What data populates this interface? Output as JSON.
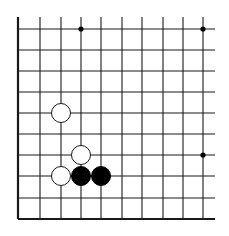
{
  "board": {
    "description": "Go board corner fragment (lower-left corner)",
    "colors": {
      "background": "#ffffff",
      "line": "#1a1a1a",
      "black_stone": "#000000",
      "white_stone_fill": "#ffffff",
      "white_stone_stroke": "#1a1a1a",
      "star_point": "#000000"
    },
    "columns_x": [
      18,
      40,
      61,
      81,
      101,
      122,
      142,
      163,
      183,
      203
    ],
    "rows_y": [
      29,
      50,
      71,
      92,
      113,
      134,
      155,
      176,
      198,
      219
    ],
    "right_extent_x": 215,
    "top_extent_y": 17,
    "star_points": [
      {
        "col": 3,
        "row": 0
      },
      {
        "col": 9,
        "row": 0
      },
      {
        "col": 9,
        "row": 6
      }
    ],
    "stones": [
      {
        "color": "white",
        "col": 2,
        "row": 4
      },
      {
        "color": "white",
        "col": 3,
        "row": 6
      },
      {
        "color": "white",
        "col": 2,
        "row": 7
      },
      {
        "color": "black",
        "col": 3,
        "row": 7
      },
      {
        "color": "black",
        "col": 4,
        "row": 7
      }
    ],
    "stone_radius": 9.5
  }
}
